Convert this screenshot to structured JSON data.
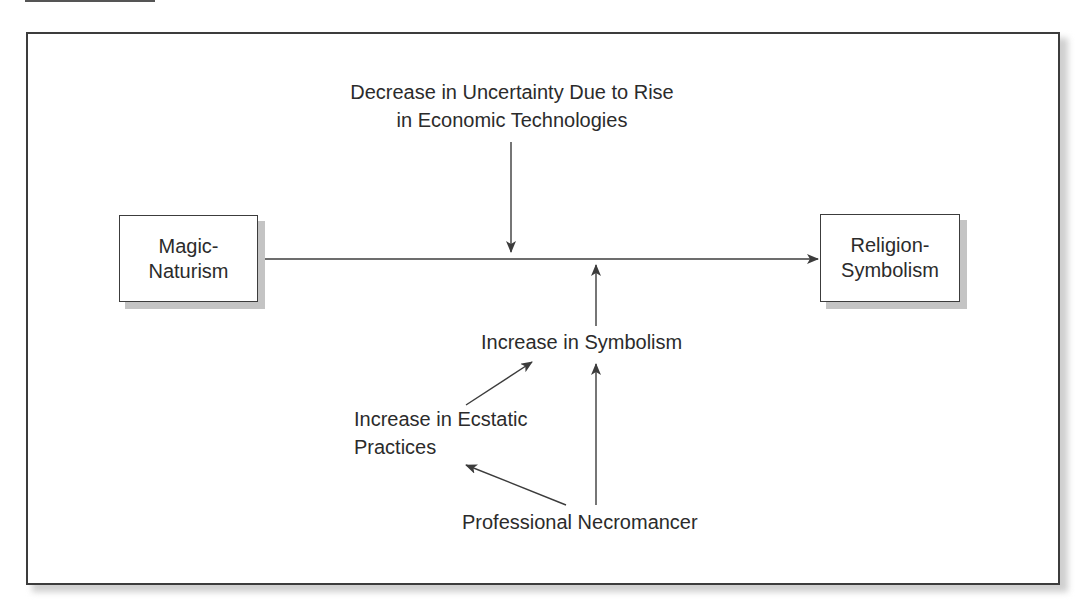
{
  "diagram": {
    "nodes": {
      "magic_naturism": {
        "line1": "Magic-",
        "line2": "Naturism"
      },
      "religion_symbolism": {
        "line1": "Religion-",
        "line2": "Symbolism"
      }
    },
    "labels": {
      "uncertainty": {
        "line1": "Decrease in Uncertainty Due to Rise",
        "line2": "in Economic Technologies"
      },
      "symbolism": {
        "line1": "Increase in Symbolism"
      },
      "ecstatic": {
        "line1": "Increase in Ecstatic",
        "line2": "Practices"
      },
      "necromancer": {
        "line1": "Professional Necromancer"
      }
    },
    "edges": [
      {
        "from": "Magic-Naturism",
        "to": "Religion-Symbolism"
      },
      {
        "from": "Decrease in Uncertainty Due to Rise in Economic Technologies",
        "to": "Magic-Naturism → Religion-Symbolism"
      },
      {
        "from": "Increase in Symbolism",
        "to": "Magic-Naturism → Religion-Symbolism"
      },
      {
        "from": "Increase in Ecstatic Practices",
        "to": "Increase in Symbolism"
      },
      {
        "from": "Professional Necromancer",
        "to": "Increase in Symbolism"
      },
      {
        "from": "Professional Necromancer",
        "to": "Increase in Ecstatic Practices"
      }
    ],
    "colors": {
      "stroke": "#3c3c3c",
      "text": "#2b2b2b",
      "shadow": "#c4c4c4"
    }
  }
}
